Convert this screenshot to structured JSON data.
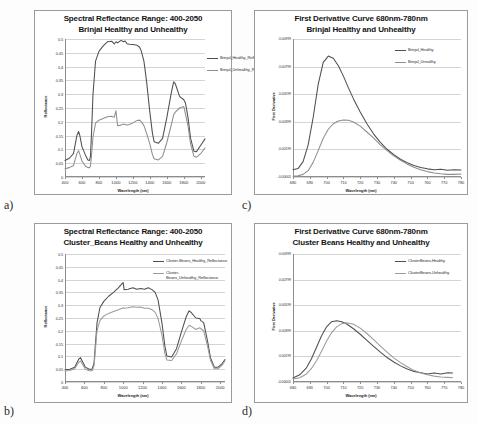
{
  "figure": {
    "background": "#fdfdfd",
    "panel_labels": [
      "a)",
      "b)",
      "c)",
      "d)"
    ]
  },
  "panels": {
    "a": {
      "letter": "a)",
      "title_line1": "Spectral Reflectance Range: 400-2050",
      "title_line2": "Brinjal Healthy and Unhealthy"
    },
    "b": {
      "letter": "b)",
      "title_line1": "Spectral Reflectance Range: 400-2050",
      "title_line2": "Cluster_Beans Healthy and Unhealthy"
    },
    "c": {
      "letter": "c)",
      "title_line1": "First Derivative Curve 680nm-780nm",
      "title_line2": "Brinjal Healthy and Unhealthy"
    },
    "d": {
      "letter": "d)",
      "title_line1": "First Derivative Curve 680nm-780nm",
      "title_line2": "Cluster Beans Healthy and Unhealthy"
    }
  },
  "chart_data": [
    {
      "id": "a",
      "type": "line",
      "title": "Spectral Reflectance Range: 400-2050 Brinjal Healthy and Unhealthy",
      "xlabel": "Wavelength (nm)",
      "ylabel": "Reflectance",
      "xlim": [
        400,
        2050
      ],
      "ylim": [
        0,
        0.5
      ],
      "xticks": [
        400,
        600,
        800,
        1000,
        1200,
        1400,
        1600,
        1800,
        2000
      ],
      "yticks": [
        0,
        0.05,
        0.1,
        0.15,
        0.2,
        0.25,
        0.3,
        0.35,
        0.4,
        0.45,
        0.5
      ],
      "grid": true,
      "legend_position": "top-right-outside",
      "series": [
        {
          "name": "Brinjal_Healthy_Reflectance",
          "color": "#4f4f4f",
          "x": [
            400,
            450,
            500,
            540,
            560,
            575,
            600,
            640,
            670,
            690,
            700,
            710,
            730,
            760,
            800,
            850,
            900,
            950,
            980,
            1000,
            1020,
            1060,
            1090,
            1110,
            1130,
            1160,
            1200,
            1250,
            1280,
            1300,
            1330,
            1360,
            1400,
            1430,
            1450,
            1500,
            1550,
            1600,
            1650,
            1680,
            1700,
            1750,
            1800,
            1820,
            1850,
            1880,
            1920,
            1950,
            2000,
            2050
          ],
          "y": [
            0.06,
            0.068,
            0.085,
            0.15,
            0.165,
            0.15,
            0.11,
            0.08,
            0.062,
            0.06,
            0.075,
            0.14,
            0.3,
            0.42,
            0.455,
            0.475,
            0.49,
            0.492,
            0.482,
            0.49,
            0.486,
            0.495,
            0.49,
            0.493,
            0.483,
            0.481,
            0.48,
            0.477,
            0.47,
            0.455,
            0.42,
            0.35,
            0.235,
            0.16,
            0.128,
            0.122,
            0.14,
            0.215,
            0.3,
            0.345,
            0.338,
            0.292,
            0.28,
            0.268,
            0.215,
            0.14,
            0.093,
            0.092,
            0.115,
            0.138
          ]
        },
        {
          "name": "Brinjal_Unhealthy_Reflectance",
          "color": "#8e8e8e",
          "x": [
            400,
            450,
            500,
            540,
            560,
            575,
            600,
            640,
            670,
            690,
            700,
            710,
            730,
            760,
            800,
            850,
            900,
            950,
            980,
            1000,
            1020,
            1060,
            1090,
            1110,
            1130,
            1160,
            1200,
            1250,
            1280,
            1300,
            1330,
            1360,
            1400,
            1430,
            1450,
            1500,
            1550,
            1600,
            1650,
            1680,
            1700,
            1750,
            1800,
            1820,
            1850,
            1880,
            1920,
            1950,
            2000,
            2050
          ],
          "y": [
            0.03,
            0.034,
            0.042,
            0.085,
            0.095,
            0.082,
            0.058,
            0.04,
            0.034,
            0.034,
            0.04,
            0.07,
            0.145,
            0.195,
            0.206,
            0.212,
            0.218,
            0.22,
            0.216,
            0.24,
            0.186,
            0.188,
            0.192,
            0.19,
            0.188,
            0.19,
            0.196,
            0.205,
            0.206,
            0.2,
            0.186,
            0.16,
            0.12,
            0.082,
            0.066,
            0.062,
            0.075,
            0.125,
            0.185,
            0.225,
            0.235,
            0.25,
            0.255,
            0.228,
            0.185,
            0.12,
            0.075,
            0.072,
            0.085,
            0.105
          ]
        }
      ]
    },
    {
      "id": "b",
      "type": "line",
      "title": "Spectral Reflectance Range: 400-2050 Cluster_Beans Healthy and Unhealthy",
      "xlabel": "Wavelength (nm)",
      "ylabel": "Reflectance",
      "xlim": [
        400,
        2050
      ],
      "ylim": [
        0,
        0.5
      ],
      "xticks": [
        400,
        600,
        800,
        1000,
        1200,
        1400,
        1600,
        1800,
        2000
      ],
      "yticks": [
        0,
        0.05,
        0.1,
        0.15,
        0.2,
        0.25,
        0.3,
        0.35,
        0.4,
        0.45,
        0.5
      ],
      "grid": true,
      "legend_position": "top-right-inside",
      "series": [
        {
          "name": "Cluster-Beans_Healthy_Reflectance",
          "color": "#4f4f4f",
          "x": [
            400,
            450,
            500,
            540,
            560,
            580,
            610,
            650,
            680,
            700,
            710,
            730,
            760,
            800,
            850,
            900,
            950,
            990,
            1000,
            1010,
            1050,
            1100,
            1140,
            1180,
            1220,
            1260,
            1300,
            1330,
            1360,
            1400,
            1430,
            1450,
            1500,
            1550,
            1600,
            1650,
            1680,
            1700,
            1750,
            1790,
            1800,
            1830,
            1870,
            1900,
            1940,
            1980,
            2020,
            2050
          ],
          "y": [
            0.048,
            0.05,
            0.058,
            0.088,
            0.095,
            0.08,
            0.058,
            0.05,
            0.05,
            0.075,
            0.13,
            0.23,
            0.29,
            0.315,
            0.335,
            0.35,
            0.368,
            0.385,
            0.388,
            0.36,
            0.362,
            0.368,
            0.362,
            0.365,
            0.362,
            0.368,
            0.36,
            0.35,
            0.32,
            0.23,
            0.14,
            0.102,
            0.098,
            0.13,
            0.195,
            0.255,
            0.278,
            0.272,
            0.25,
            0.248,
            0.24,
            0.232,
            0.16,
            0.095,
            0.058,
            0.058,
            0.072,
            0.088
          ]
        },
        {
          "name": "Cluster-\nBeans_Unhealthy_Reflectance",
          "color": "#9b9b9b",
          "x": [
            400,
            450,
            500,
            540,
            560,
            580,
            610,
            650,
            680,
            700,
            710,
            730,
            760,
            800,
            850,
            900,
            950,
            990,
            1000,
            1010,
            1050,
            1100,
            1140,
            1180,
            1220,
            1260,
            1300,
            1330,
            1360,
            1400,
            1430,
            1450,
            1500,
            1550,
            1600,
            1650,
            1680,
            1700,
            1750,
            1790,
            1800,
            1830,
            1870,
            1900,
            1940,
            1980,
            2020,
            2050
          ],
          "y": [
            0.043,
            0.045,
            0.052,
            0.076,
            0.082,
            0.07,
            0.05,
            0.044,
            0.044,
            0.064,
            0.11,
            0.2,
            0.24,
            0.258,
            0.268,
            0.275,
            0.282,
            0.288,
            0.29,
            0.288,
            0.29,
            0.294,
            0.292,
            0.293,
            0.288,
            0.288,
            0.282,
            0.272,
            0.248,
            0.182,
            0.112,
            0.086,
            0.084,
            0.11,
            0.16,
            0.205,
            0.222,
            0.218,
            0.205,
            0.212,
            0.208,
            0.2,
            0.14,
            0.085,
            0.052,
            0.052,
            0.066,
            0.082
          ]
        }
      ]
    },
    {
      "id": "c",
      "type": "line",
      "title": "First Derivative Curve 680nm-780nm Brinjal Healthy and Unhealthy",
      "xlabel": "Wavelength (nm)",
      "ylabel": "First Derivative",
      "xlim": [
        680,
        780
      ],
      "ylim": [
        -1e-05,
        0.00999
      ],
      "xticks": [
        680,
        690,
        700,
        710,
        720,
        730,
        740,
        750,
        760,
        770,
        780
      ],
      "yticks": [
        -1e-05,
        0.00199,
        0.00399,
        0.00599,
        0.00799,
        0.00999
      ],
      "ytick_labels": [
        "-0.00001",
        "0.00199",
        "0.00399",
        "0.00599",
        "0.00799",
        "0.00999"
      ],
      "grid": true,
      "legend_position": "top-right-inside",
      "series": [
        {
          "name": "Brinjal_Healthy",
          "color": "#4f4f4f",
          "x": [
            680,
            683,
            686,
            689,
            692,
            695,
            698,
            701,
            704,
            707,
            710,
            713,
            716,
            720,
            724,
            728,
            732,
            736,
            740,
            744,
            748,
            752,
            756,
            760,
            764,
            768,
            772,
            776,
            780
          ],
          "y": [
            0.00052,
            0.0006,
            0.0011,
            0.0023,
            0.0043,
            0.0067,
            0.0083,
            0.00875,
            0.0086,
            0.00805,
            0.0073,
            0.00645,
            0.00565,
            0.0047,
            0.00385,
            0.0031,
            0.0025,
            0.002,
            0.0016,
            0.00128,
            0.00102,
            0.00082,
            0.00068,
            0.00058,
            0.00052,
            0.00055,
            0.00048,
            0.00052,
            0.0005
          ]
        },
        {
          "name": "Brinjal_Unealthy",
          "color": "#8e8e8e",
          "x": [
            680,
            683,
            686,
            689,
            692,
            695,
            698,
            701,
            704,
            707,
            710,
            713,
            716,
            720,
            724,
            728,
            732,
            736,
            740,
            744,
            748,
            752,
            756,
            760,
            764,
            768,
            772,
            776,
            780
          ],
          "y": [
            5e-05,
            8e-05,
            0.00018,
            0.00045,
            0.00105,
            0.0019,
            0.0028,
            0.00345,
            0.00385,
            0.00405,
            0.00412,
            0.0041,
            0.00398,
            0.00368,
            0.00325,
            0.0028,
            0.00232,
            0.0019,
            0.00152,
            0.0012,
            0.00092,
            0.0007,
            0.00052,
            0.00038,
            0.00028,
            0.00022,
            0.00018,
            0.00018,
            0.0002
          ]
        }
      ]
    },
    {
      "id": "d",
      "type": "line",
      "title": "First Derivative Curve 680nm-780nm Cluster Beans Healthy and Unhealthy",
      "xlabel": "Wavelength (nm)",
      "ylabel": "First Derivative",
      "xlim": [
        680,
        780
      ],
      "ylim": [
        -1e-05,
        0.00999
      ],
      "xticks": [
        680,
        690,
        700,
        710,
        720,
        730,
        740,
        750,
        760,
        770,
        780
      ],
      "yticks": [
        -1e-05,
        0.00199,
        0.00399,
        0.00599,
        0.00799,
        0.00999
      ],
      "ytick_labels": [
        "-0.00001",
        "0.00199",
        "0.00399",
        "0.00599",
        "0.00799",
        "0.00999"
      ],
      "grid": true,
      "legend_position": "top-right-inside",
      "series": [
        {
          "name": "ClusterBeans-Healthy",
          "color": "#4f4f4f",
          "x": [
            680,
            684,
            688,
            691,
            694,
            697,
            700,
            703,
            706,
            709,
            712,
            716,
            720,
            724,
            728,
            732,
            736,
            740,
            744,
            748,
            752,
            756,
            760,
            764,
            768,
            772,
            775
          ],
          "y": [
            0.0003,
            0.00055,
            0.0011,
            0.0018,
            0.0027,
            0.0036,
            0.0043,
            0.0047,
            0.00478,
            0.0047,
            0.00452,
            0.00415,
            0.00372,
            0.00325,
            0.00278,
            0.00232,
            0.0019,
            0.00155,
            0.00125,
            0.001,
            0.00082,
            0.00072,
            0.00062,
            0.0007,
            0.00062,
            0.00072,
            0.0007
          ]
        },
        {
          "name": "ClusterBeans-Unhealthy",
          "color": "#9b9b9b",
          "x": [
            680,
            684,
            688,
            691,
            694,
            697,
            700,
            703,
            706,
            709,
            712,
            716,
            720,
            724,
            728,
            732,
            736,
            740,
            744,
            748,
            752,
            756,
            760,
            764,
            768,
            772,
            775
          ],
          "y": [
            0.00022,
            0.00032,
            0.00062,
            0.00105,
            0.00165,
            0.0024,
            0.0032,
            0.00385,
            0.0043,
            0.00455,
            0.00462,
            0.0045,
            0.0042,
            0.00378,
            0.0033,
            0.0028,
            0.00232,
            0.00188,
            0.0015,
            0.00118,
            0.0009,
            0.0007,
            0.00055,
            0.00045,
            0.00038,
            0.00035,
            0.00032
          ]
        }
      ]
    }
  ]
}
